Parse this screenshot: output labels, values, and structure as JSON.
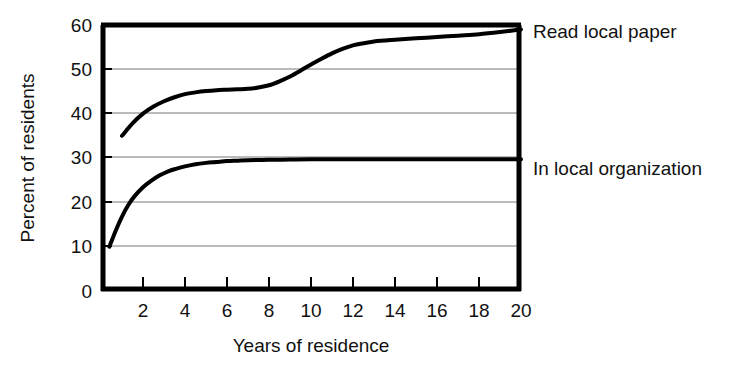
{
  "chart_data": {
    "type": "line",
    "title": "",
    "xlabel": "Years of residence",
    "ylabel": "Percent of residents",
    "xlim": [
      0,
      20
    ],
    "ylim": [
      0,
      60
    ],
    "grid": true,
    "legend_position": "right-of-plot-inline",
    "xticks": [
      2,
      4,
      6,
      8,
      10,
      12,
      14,
      16,
      18,
      20
    ],
    "xtick_labels": [
      "2",
      "4",
      "6",
      "8",
      "10",
      "12",
      "14",
      "16",
      "18",
      "20"
    ],
    "yticks": [
      0,
      10,
      20,
      30,
      40,
      50,
      60
    ],
    "ytick_labels": [
      "0",
      "10",
      "20",
      "30",
      "40",
      "50",
      "60"
    ],
    "series": [
      {
        "name": "Read local paper",
        "label": "Read local paper",
        "color": "#000000",
        "x": [
          1,
          1.5,
          2,
          2.5,
          3,
          3.5,
          4,
          4.5,
          5,
          5.5,
          6,
          6.5,
          7,
          7.5,
          8,
          8.5,
          9,
          9.5,
          10,
          10.5,
          11,
          11.5,
          12,
          12.5,
          13,
          13.5,
          14,
          15,
          16,
          17,
          18,
          19,
          20
        ],
        "values": [
          35,
          37.8,
          40,
          41.6,
          42.8,
          43.7,
          44.4,
          44.8,
          45.1,
          45.3,
          45.4,
          45.5,
          45.6,
          45.9,
          46.4,
          47.3,
          48.4,
          49.7,
          51.1,
          52.4,
          53.6,
          54.6,
          55.4,
          55.9,
          56.3,
          56.5,
          56.7,
          57.0,
          57.3,
          57.6,
          57.9,
          58.4,
          59.0
        ]
      },
      {
        "name": "In local organization",
        "label": "In local organization",
        "color": "#000000",
        "x": [
          0.4,
          0.7,
          1,
          1.3,
          1.6,
          2,
          2.4,
          2.8,
          3.2,
          3.6,
          4,
          4.5,
          5,
          5.5,
          6,
          6.5,
          7,
          8,
          9,
          10,
          12,
          14,
          16,
          18,
          20
        ],
        "values": [
          10,
          13.6,
          16.8,
          19.4,
          21.4,
          23.4,
          24.9,
          26.1,
          27.0,
          27.6,
          28.1,
          28.6,
          28.9,
          29.1,
          29.3,
          29.4,
          29.5,
          29.6,
          29.65,
          29.7,
          29.7,
          29.7,
          29.7,
          29.7,
          29.7
        ]
      }
    ],
    "annotations": []
  },
  "legend": {
    "top_label": "Read local paper",
    "bottom_label": "In local organization"
  }
}
